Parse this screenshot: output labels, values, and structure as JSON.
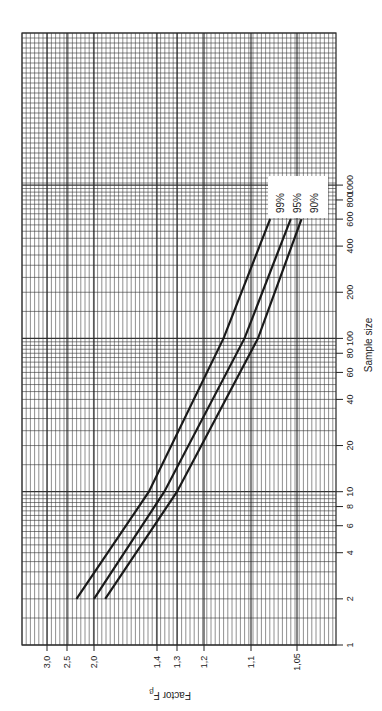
{
  "chart_data": {
    "type": "line",
    "orientation": "rotated-90-ccw",
    "title": "",
    "xlabel": "Sample size",
    "ylabel": "Factor F_β",
    "xscale": "log",
    "yscale": "log",
    "xlim": [
      1,
      1000
    ],
    "x_ticks": [
      1,
      2,
      4,
      6,
      8,
      10,
      20,
      40,
      60,
      80,
      100,
      200,
      400,
      600,
      800,
      1000
    ],
    "x_tick_labels": [
      "1",
      "2",
      "4",
      "6",
      "8",
      "10",
      "20",
      "40",
      "60",
      "80",
      "100",
      "200",
      "400",
      "600",
      "800",
      "1000"
    ],
    "y_ticks": [
      3.0,
      2.5,
      2.0,
      1.4,
      1.3,
      1.2,
      1.1,
      1.05
    ],
    "y_tick_labels": [
      "3,0",
      "2,5",
      "2,0",
      "1,4",
      "1,3",
      "1,2",
      "1,1",
      "1,05"
    ],
    "grid": true,
    "legend_position": "upper-right (inline labels at line ends)",
    "series": [
      {
        "name": "99%",
        "x": [
          2,
          10,
          100,
          600
        ],
        "values": [
          2.3,
          1.45,
          1.15,
          1.075
        ]
      },
      {
        "name": "95%",
        "x": [
          2,
          10,
          100,
          600
        ],
        "values": [
          2.0,
          1.36,
          1.11,
          1.055
        ]
      },
      {
        "name": "90%",
        "x": [
          2,
          10,
          100,
          600
        ],
        "values": [
          1.85,
          1.3,
          1.09,
          1.045
        ]
      }
    ]
  },
  "labels": {
    "xlabel": "Sample size",
    "ylabel": "Factor F",
    "ylabel_sub": "β",
    "legend": [
      "99%",
      "95%",
      "90%"
    ]
  }
}
